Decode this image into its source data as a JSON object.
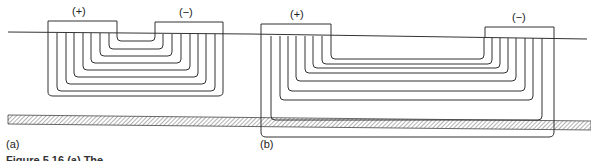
{
  "figure": {
    "panel_a": {
      "label": "(a)",
      "electrode_plus": "(+)",
      "electrode_minus": "(−)"
    },
    "panel_b": {
      "label": "(b)",
      "electrode_plus": "(+)",
      "electrode_minus": "(−)"
    },
    "caption_partial": "Figure 5.16  (a) The..."
  },
  "colors": {
    "line": "#333333",
    "hatch": "#555555"
  }
}
